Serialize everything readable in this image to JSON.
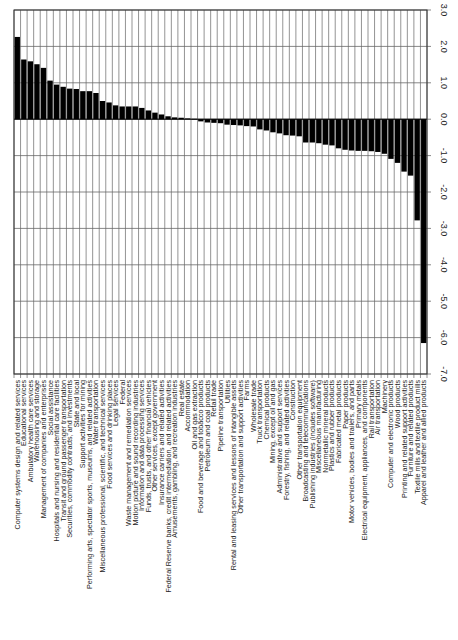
{
  "chart_data": {
    "type": "bar",
    "orientation": "rotated-90-ccw",
    "title": "",
    "xlabel": "",
    "ylabel": "",
    "ylim": [
      -7.0,
      3.0
    ],
    "yticks": [
      "3.0",
      "2.0",
      "1.0",
      "0.0",
      "-1.0",
      "-2.0",
      "-3.0",
      "-4.0",
      "-5.0",
      "-6.0",
      "-7.0"
    ],
    "grid": true,
    "legend": null,
    "bar_color": "#000000",
    "categories": [
      "Computer systems design and related services",
      "Educational services",
      "Ambulatory health care services",
      "Warehousing and storage",
      "Management of companies and enterprises",
      "Social assistance",
      "Hospitals and nursing and residential care facilities",
      "Transit and ground passenger transportation",
      "Securities, commodity contracts, and investments",
      "State and local",
      "Support activities for mining",
      "Performing arts, spectator sports, museums, and related activities",
      "Water transportation",
      "Miscellaneous professional, scientific, and technical services",
      "Food services and drinking places",
      "Legal services",
      "Federal",
      "Waste management and remediation services",
      "Motion picture and sound recording industries",
      "Information and data processing services",
      "Funds, trusts, and other financial vehicles",
      "Other services, except government",
      "Insurance carriers and related activities",
      "Federal Reserve banks, credit intermediation, and related activities",
      "Amusements, gambling, and recreation industries",
      "Real estate",
      "Accommodation",
      "Oil and gas extraction",
      "Food and beverage and tobacco products",
      "Petroleum and coal products",
      "Retail trade",
      "Pipeline transportation",
      "Utilities",
      "Rental and leasing services and lessors of intangible assets",
      "Other transportation and support activities",
      "Farms",
      "Wholesale trade",
      "Truck transportation",
      "Chemical products",
      "Mining, except oil and gas",
      "Administrative and support services",
      "Forestry, fishing, and related activities",
      "Construction",
      "Other transportation equipment",
      "Broadcasting and telecommunications",
      "Publishing industries (includes software)",
      "Miscellaneous manufacturing",
      "Nonmetallic mineral products",
      "Plastics and rubber products",
      "Fabricated metal products",
      "Paper products",
      "Motor vehicles, bodies and trailers, and parts",
      "Primary metals",
      "Electrical equipment, appliances, and components",
      "Rail transportation",
      "Air transportation",
      "Machinery",
      "Computer and electronic products",
      "Wood products",
      "Printing and related support activities",
      "Furniture and related products",
      "Textile mills and textile product mills",
      "Apparel and leather and allied products"
    ],
    "values": [
      2.26,
      1.64,
      1.59,
      1.51,
      1.41,
      1.06,
      0.95,
      0.89,
      0.84,
      0.83,
      0.77,
      0.77,
      0.72,
      0.5,
      0.46,
      0.38,
      0.35,
      0.35,
      0.35,
      0.31,
      0.24,
      0.18,
      0.13,
      0.08,
      0.05,
      0.04,
      0.02,
      0.01,
      -0.06,
      -0.09,
      -0.1,
      -0.11,
      -0.15,
      -0.16,
      -0.17,
      -0.19,
      -0.2,
      -0.28,
      -0.31,
      -0.36,
      -0.39,
      -0.44,
      -0.45,
      -0.47,
      -0.64,
      -0.64,
      -0.66,
      -0.7,
      -0.72,
      -0.8,
      -0.84,
      -0.86,
      -0.87,
      -0.87,
      -0.88,
      -0.9,
      -0.95,
      -1.09,
      -1.2,
      -1.44,
      -1.55,
      -2.78,
      -6.15
    ]
  }
}
